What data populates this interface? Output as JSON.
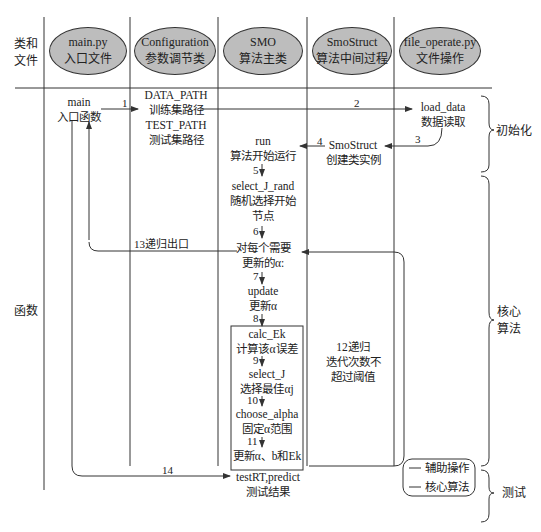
{
  "row_headers": {
    "classes_files": [
      "类和",
      "文件"
    ],
    "functions": "函数"
  },
  "columns": [
    {
      "name": "main.py",
      "desc": "入口文件"
    },
    {
      "name": "Configuration",
      "desc": "参数调节类"
    },
    {
      "name": "SMO",
      "desc": "算法主类"
    },
    {
      "name": "SmoStruct",
      "desc": "算法中间过程"
    },
    {
      "name": "file_operate.py",
      "desc": "文件操作"
    }
  ],
  "nodes": {
    "main": {
      "name": "main",
      "desc": "入口函数"
    },
    "config": {
      "l1": "DATA_PATH",
      "l2": "训练集路径",
      "l3": "TEST_PATH",
      "l4": "测试集路径"
    },
    "load_data": {
      "name": "load_data",
      "desc": "数据读取"
    },
    "smostruct": {
      "name": "SmoStruct",
      "desc": "创建类实例"
    },
    "run": {
      "name": "run",
      "desc": "算法开始运行"
    },
    "select_j_rand": {
      "name": "select_J_rand",
      "desc1": "随机选择开始",
      "desc2": "节点"
    },
    "for_each": {
      "l1": "对每个需要",
      "l2": "更新的α:"
    },
    "update": {
      "name": "update",
      "desc": "更新α"
    },
    "calc_ek": {
      "name": "calc_Ek",
      "desc": "计算该α误差"
    },
    "select_j": {
      "name": "select_J",
      "desc": "选择最佳αj"
    },
    "choose_alpha": {
      "name": "choose_alpha",
      "desc": "固定α范围"
    },
    "update_all": {
      "desc": "更新α、b和Ek"
    },
    "test": {
      "name": "testRT,predict",
      "desc": "测试结果"
    }
  },
  "edges": {
    "e1": "1",
    "e2": "2",
    "e3": "3",
    "e4": "4",
    "e5": "5",
    "e6": "6",
    "e7": "7",
    "e8": "8",
    "e9": "9",
    "e10": "10",
    "e11": "11",
    "e12": [
      "12递归",
      "迭代次数不",
      "超过阈值"
    ],
    "e13": "13递归出口",
    "e14": "14"
  },
  "phases": {
    "init": "初始化",
    "core": [
      "核心",
      "算法"
    ],
    "test": "测试"
  },
  "legend": {
    "aux": "辅助操作",
    "core": "核心算法"
  },
  "colors": {
    "ellipse_fill": "#bdbdbd",
    "line": "#333333"
  }
}
